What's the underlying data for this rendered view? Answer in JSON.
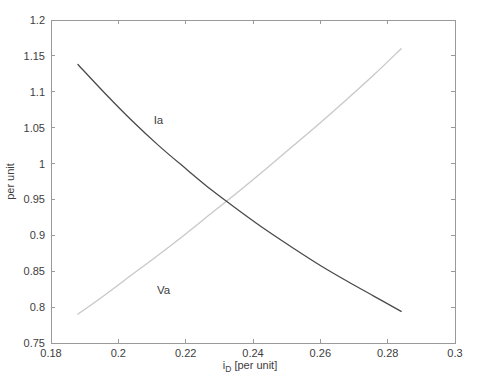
{
  "chart_data": {
    "type": "line",
    "title": "",
    "xlabel": "i_D [per unit]",
    "xlabel_main": "i",
    "xlabel_sub": "D",
    "xlabel_rest": "[per unit]",
    "ylabel": "per unit",
    "xlim": [
      0.18,
      0.3
    ],
    "ylim": [
      0.75,
      1.2
    ],
    "xticks": [
      0.18,
      0.2,
      0.22,
      0.24,
      0.26,
      0.28,
      0.3
    ],
    "xtick_labels": [
      "0.18",
      "0.2",
      "0.22",
      "0.24",
      "0.26",
      "0.28",
      "0.3"
    ],
    "yticks": [
      0.75,
      0.8,
      0.85,
      0.9,
      0.95,
      1.0,
      1.05,
      1.1,
      1.15,
      1.2
    ],
    "ytick_labels": [
      "0.75",
      "0.8",
      "0.85",
      "0.9",
      "0.95",
      "1",
      "1.05",
      "1.1",
      "1.15",
      "1.2"
    ],
    "grid": false,
    "legend_position": "none",
    "x": [
      0.188,
      0.196,
      0.204,
      0.212,
      0.22,
      0.228,
      0.236,
      0.244,
      0.252,
      0.26,
      0.268,
      0.276,
      0.284
    ],
    "series": [
      {
        "name": "Ia",
        "color": "#4a4a4a",
        "values": [
          1.138,
          1.098,
          1.06,
          1.025,
          0.993,
          0.962,
          0.934,
          0.907,
          0.882,
          0.858,
          0.836,
          0.815,
          0.794
        ]
      },
      {
        "name": "Va",
        "color": "#c8c8c8",
        "values": [
          0.79,
          0.817,
          0.845,
          0.873,
          0.902,
          0.932,
          0.962,
          0.993,
          1.025,
          1.057,
          1.09,
          1.124,
          1.16
        ]
      }
    ],
    "annotations": [
      {
        "text": "Ia",
        "x": 0.2105,
        "y": 1.055
      },
      {
        "text": "Va",
        "x": 0.2115,
        "y": 0.818
      }
    ],
    "axis_color": "#9a9a9a",
    "text_color": "#3d3d3d",
    "background": "#ffffff"
  }
}
